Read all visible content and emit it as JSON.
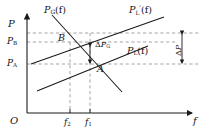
{
  "figure": {
    "type": "line-diagram",
    "axes": {
      "origin_label": "O",
      "y_axis_label": "P",
      "x_axis_label": "f",
      "y_ticks": [
        {
          "id": "PB",
          "label": "P",
          "sub": "B",
          "y_px": 42
        },
        {
          "id": "PA",
          "label": "P",
          "sub": "A",
          "y_px": 64
        }
      ],
      "x_ticks": [
        {
          "id": "f2",
          "label": "f",
          "sub": "2",
          "x_px": 70
        },
        {
          "id": "f1",
          "label": "f",
          "sub": "1",
          "x_px": 90
        }
      ]
    },
    "curves": [
      {
        "id": "PG",
        "label": "P",
        "sub": "G",
        "prime": "",
        "arg": "(f)",
        "style": "solid",
        "slope": "negative"
      },
      {
        "id": "PL_prime",
        "label": "P",
        "sub": "L",
        "prime": "′",
        "arg": "(f)",
        "style": "solid",
        "slope": "positive"
      },
      {
        "id": "PL",
        "label": "P",
        "sub": "L",
        "prime": "",
        "arg": "(f)",
        "style": "solid",
        "slope": "positive"
      }
    ],
    "points": [
      {
        "id": "B",
        "label": "B",
        "x_px": 70,
        "y_px": 42
      },
      {
        "id": "A",
        "label": "A",
        "x_px": 90,
        "y_px": 64
      }
    ],
    "annotations": [
      {
        "id": "dPG",
        "delta": "Δ",
        "label": "P",
        "sub": "G",
        "orientation": "horizontal"
      },
      {
        "id": "dP",
        "delta": "Δ",
        "label": "P",
        "sub": "",
        "orientation": "vertical"
      }
    ],
    "colors": {
      "line": "#1a1a1a",
      "dashed": "#8c8c8c",
      "background": "#ffffff"
    }
  }
}
